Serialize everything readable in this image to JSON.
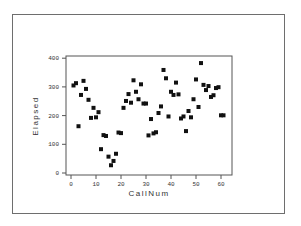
{
  "chart_data": {
    "type": "scatter",
    "title": "",
    "xlabel": "CallNum",
    "ylabel": "Elapsed",
    "xlim": [
      -2,
      64
    ],
    "ylim": [
      -5,
      405
    ],
    "xticks": [
      0,
      10,
      20,
      30,
      40,
      50,
      60
    ],
    "yticks": [
      0,
      100,
      200,
      300,
      400
    ],
    "grid": false,
    "legend": null,
    "marker": "square",
    "marker_color": "#111111",
    "series": [
      {
        "name": "Elapsed",
        "x": [
          1,
          2,
          3,
          4,
          5,
          6,
          7,
          8,
          9,
          10,
          11,
          12,
          13,
          14,
          15,
          16,
          17,
          18,
          19,
          20,
          21,
          22,
          23,
          24,
          25,
          26,
          27,
          28,
          29,
          30,
          31,
          32,
          33,
          34,
          35,
          36,
          37,
          38,
          39,
          40,
          41,
          42,
          43,
          44,
          45,
          46,
          47,
          48,
          49,
          50,
          51,
          52,
          53,
          54,
          55,
          56,
          57,
          58,
          59,
          60,
          61
        ],
        "y": [
          305,
          313,
          163,
          272,
          321,
          293,
          255,
          192,
          227,
          194,
          212,
          83,
          132,
          129,
          57,
          27,
          42,
          67,
          141,
          139,
          227,
          251,
          275,
          245,
          323,
          283,
          257,
          309,
          242,
          242,
          131,
          188,
          138,
          142,
          209,
          232,
          359,
          330,
          197,
          283,
          272,
          315,
          274,
          190,
          197,
          146,
          216,
          194,
          257,
          326,
          230,
          383,
          307,
          289,
          303,
          265,
          271,
          296,
          299,
          201,
          201
        ]
      }
    ]
  }
}
